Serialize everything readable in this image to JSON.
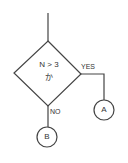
{
  "diagram": {
    "type": "flowchart",
    "decision": {
      "line1": "N > 3",
      "line2": "か"
    },
    "branches": {
      "yes_label": "YES",
      "no_label": "NO"
    },
    "connectors": {
      "a_label": "A",
      "b_label": "B"
    },
    "colors": {
      "stroke": "#444444",
      "background": "#ffffff"
    }
  }
}
